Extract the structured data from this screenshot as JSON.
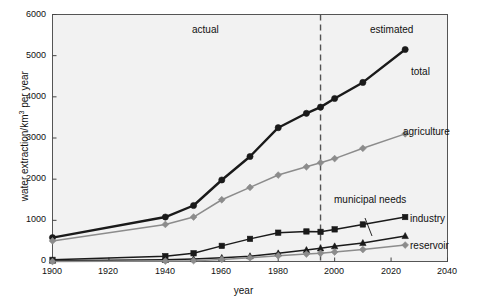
{
  "chart_data": {
    "type": "line",
    "title": "",
    "xlabel": "year",
    "ylabel": "water extraction/km3 per year",
    "ylabel_base": "water extraction/km",
    "ylabel_sup": "3",
    "ylabel_tail": " per year",
    "xlim": [
      1900,
      2040
    ],
    "ylim": [
      0,
      6000
    ],
    "x_ticks": [
      1900,
      1920,
      1940,
      1960,
      1980,
      2000,
      2020,
      2040
    ],
    "y_ticks": [
      0,
      1000,
      2000,
      3000,
      4000,
      5000,
      6000
    ],
    "grid": false,
    "legend": "inline-labels",
    "annotations": [
      {
        "text": "actual",
        "x": 1957,
        "y": 5650
      },
      {
        "text": "estimated",
        "x": 2013,
        "y": 5650
      }
    ],
    "divider": {
      "x": 1995,
      "style": "dashed",
      "color": "#555555"
    },
    "series": [
      {
        "name": "total",
        "label": "total",
        "color": "#1a1a1a",
        "marker": "circle",
        "x": [
          1900,
          1940,
          1950,
          1960,
          1970,
          1980,
          1990,
          1995,
          2000,
          2010,
          2025
        ],
        "y": [
          580,
          1080,
          1360,
          1980,
          2550,
          3250,
          3600,
          3750,
          3960,
          4350,
          5150
        ]
      },
      {
        "name": "agriculture",
        "label": "agriculture",
        "color": "#8c8c8c",
        "marker": "diamond",
        "x": [
          1900,
          1940,
          1950,
          1960,
          1970,
          1980,
          1990,
          1995,
          2000,
          2010,
          2025
        ],
        "y": [
          500,
          900,
          1080,
          1500,
          1800,
          2100,
          2300,
          2400,
          2500,
          2750,
          3100
        ]
      },
      {
        "name": "industry",
        "label": "industry",
        "color": "#1a1a1a",
        "marker": "square",
        "x": [
          1900,
          1940,
          1950,
          1960,
          1970,
          1980,
          1990,
          1995,
          2000,
          2010,
          2025
        ],
        "y": [
          40,
          130,
          200,
          380,
          550,
          700,
          730,
          720,
          780,
          900,
          1080
        ]
      },
      {
        "name": "municipal needs",
        "label": "municipal needs",
        "color": "#1a1a1a",
        "marker": "triangle",
        "x": [
          1900,
          1940,
          1950,
          1960,
          1970,
          1980,
          1990,
          1995,
          2000,
          2010,
          2025
        ],
        "y": [
          20,
          40,
          60,
          90,
          130,
          200,
          280,
          320,
          370,
          450,
          620
        ]
      },
      {
        "name": "reservoir",
        "label": "reservoir",
        "color": "#8c8c8c",
        "marker": "diamond",
        "x": [
          1900,
          1940,
          1950,
          1960,
          1970,
          1980,
          1990,
          1995,
          2000,
          2010,
          2025
        ],
        "y": [
          0,
          10,
          20,
          50,
          90,
          140,
          180,
          200,
          230,
          290,
          400
        ]
      }
    ]
  }
}
